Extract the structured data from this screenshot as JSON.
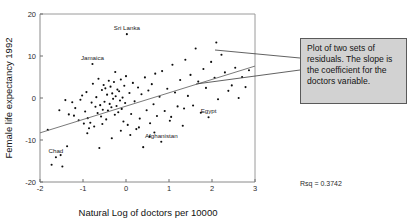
{
  "figure": {
    "y_axis_title": "Female life expectancy 1992",
    "x_axis_title": "Natural Log of doctors per 10000",
    "rsq_text": "Rsq = 0.3742",
    "callout_text": "Plot of two sets of residuals. The slope is the coefficient for the doctors variable.",
    "callout_bg": "#d2d2d2",
    "callout_border": "#5a5a5a",
    "point_color": "#0d0d0d",
    "line_color": "#6b6b6b"
  },
  "chart_data": {
    "type": "scatter",
    "title": "",
    "xlabel": "Natural Log of doctors per 10000",
    "ylabel": "Female life expectancy 1992",
    "xlim": [
      -2,
      3
    ],
    "ylim": [
      -20,
      20
    ],
    "xticks": [
      -2,
      -1,
      0,
      1,
      2,
      3
    ],
    "yticks": [
      -20,
      -10,
      0,
      10,
      20
    ],
    "grid": false,
    "legend": "none",
    "annotations": [
      {
        "label": "Sri Lanka",
        "x": 0.02,
        "y": 15.2
      },
      {
        "label": "Jamaica",
        "x": -0.78,
        "y": 8.1
      },
      {
        "label": "Egypt",
        "x": 1.92,
        "y": -4.6
      },
      {
        "label": "Afghanistan",
        "x": 0.82,
        "y": -10.4
      },
      {
        "label": "Chad",
        "x": -1.63,
        "y": -14.1
      }
    ],
    "fit_line": {
      "name": "regression line",
      "x_start": -2.0,
      "y_start": -8.3,
      "x_end": 3.0,
      "y_end": 7.6,
      "rsq": 0.3742
    },
    "series": [
      {
        "name": "residuals",
        "points": [
          [
            0.02,
            15.2
          ],
          [
            -0.78,
            8.1
          ],
          [
            1.92,
            -4.6
          ],
          [
            0.82,
            -10.4
          ],
          [
            -1.63,
            -14.1
          ],
          [
            -1.82,
            -7.6
          ],
          [
            -1.73,
            -15.9
          ],
          [
            -1.52,
            -13.6
          ],
          [
            -1.48,
            -16.3
          ],
          [
            -1.37,
            -11.5
          ],
          [
            -1.33,
            -3.9
          ],
          [
            -1.21,
            -4.2
          ],
          [
            -1.18,
            -2.4
          ],
          [
            -1.1,
            -5.3
          ],
          [
            -1.06,
            -0.4
          ],
          [
            -1.02,
            0.6
          ],
          [
            -0.98,
            -6.1
          ],
          [
            -0.95,
            -3.2
          ],
          [
            -0.92,
            1.4
          ],
          [
            -0.89,
            -4.8
          ],
          [
            -0.86,
            -7.2
          ],
          [
            -0.83,
            -5.9
          ],
          [
            -0.8,
            -1.1
          ],
          [
            -0.77,
            3.4
          ],
          [
            -0.74,
            -6.8
          ],
          [
            -0.71,
            -2.1
          ],
          [
            -0.69,
            0.2
          ],
          [
            -0.66,
            -3.6
          ],
          [
            -0.64,
            4.6
          ],
          [
            -0.62,
            -11.9
          ],
          [
            -0.6,
            -1.7
          ],
          [
            -0.58,
            -4.4
          ],
          [
            -0.56,
            1.9
          ],
          [
            -0.54,
            -2.8
          ],
          [
            -0.52,
            3.1
          ],
          [
            -0.5,
            -0.9
          ],
          [
            -0.48,
            2.3
          ],
          [
            -0.46,
            -5.1
          ],
          [
            -0.44,
            0.8
          ],
          [
            -0.42,
            -3.0
          ],
          [
            -0.4,
            4.1
          ],
          [
            -0.38,
            -1.4
          ],
          [
            -0.36,
            2.7
          ],
          [
            -0.34,
            -2.2
          ],
          [
            -0.32,
            1.1
          ],
          [
            -0.3,
            -0.2
          ],
          [
            -0.28,
            3.8
          ],
          [
            -0.26,
            -4.0
          ],
          [
            -0.24,
            0.4
          ],
          [
            -0.22,
            -1.9
          ],
          [
            -0.2,
            2.0
          ],
          [
            -0.18,
            -3.4
          ],
          [
            -0.16,
            1.6
          ],
          [
            -0.14,
            -0.6
          ],
          [
            -0.12,
            4.4
          ],
          [
            -0.1,
            -2.6
          ],
          [
            -0.08,
            0.1
          ],
          [
            -0.06,
            -5.6
          ],
          [
            -0.04,
            2.9
          ],
          [
            -0.02,
            -1.2
          ],
          [
            0.0,
            5.2
          ],
          [
            0.04,
            -6.4
          ],
          [
            0.08,
            1.2
          ],
          [
            0.12,
            -3.8
          ],
          [
            0.16,
            3.6
          ],
          [
            0.2,
            -0.8
          ],
          [
            0.24,
            -7.4
          ],
          [
            0.28,
            2.5
          ],
          [
            0.32,
            -4.9
          ],
          [
            0.36,
            0.9
          ],
          [
            0.4,
            -11.7
          ],
          [
            0.44,
            4.9
          ],
          [
            0.48,
            -2.9
          ],
          [
            0.52,
            1.8
          ],
          [
            0.56,
            -6.0
          ],
          [
            0.6,
            3.3
          ],
          [
            0.64,
            -1.5
          ],
          [
            0.68,
            5.8
          ],
          [
            0.72,
            -4.3
          ],
          [
            0.78,
            0.3
          ],
          [
            0.84,
            6.4
          ],
          [
            0.9,
            -3.1
          ],
          [
            0.96,
            2.2
          ],
          [
            1.02,
            -5.4
          ],
          [
            1.08,
            7.9
          ],
          [
            1.14,
            1.3
          ],
          [
            1.2,
            -2.0
          ],
          [
            1.26,
            4.3
          ],
          [
            1.32,
            -6.6
          ],
          [
            1.38,
            9.1
          ],
          [
            1.44,
            0.5
          ],
          [
            1.5,
            5.5
          ],
          [
            1.56,
            -1.8
          ],
          [
            1.62,
            11.8
          ],
          [
            1.68,
            3.9
          ],
          [
            1.74,
            -3.5
          ],
          [
            1.8,
            6.9
          ],
          [
            1.86,
            2.4
          ],
          [
            1.98,
            8.6
          ],
          [
            2.06,
            4.8
          ],
          [
            2.14,
            -0.3
          ],
          [
            2.22,
            10.3
          ],
          [
            2.3,
            6.1
          ],
          [
            2.38,
            1.7
          ],
          [
            2.46,
            3.0
          ],
          [
            2.54,
            7.2
          ],
          [
            2.62,
            0.0
          ],
          [
            2.7,
            5.0
          ],
          [
            2.78,
            2.6
          ],
          [
            2.86,
            6.6
          ],
          [
            -1.25,
            -1.0
          ],
          [
            -0.9,
            -8.4
          ],
          [
            -0.55,
            -6.2
          ],
          [
            -0.33,
            -9.6
          ],
          [
            0.1,
            -8.8
          ],
          [
            0.3,
            -7.0
          ],
          [
            0.55,
            -9.2
          ],
          [
            1.05,
            -4.5
          ],
          [
            1.35,
            -2.5
          ],
          [
            2.1,
            13.2
          ],
          [
            -1.55,
            -2.9
          ],
          [
            -1.41,
            -0.5
          ],
          [
            -0.25,
            6.2
          ],
          [
            -0.12,
            -7.8
          ],
          [
            0.66,
            -8.2
          ]
        ]
      }
    ]
  }
}
